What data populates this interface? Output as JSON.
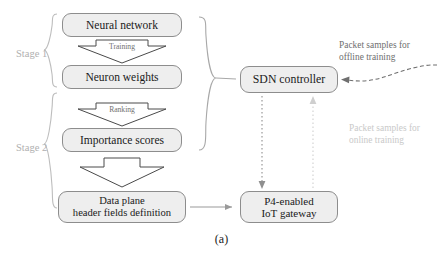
{
  "figure": {
    "caption": "(a)",
    "stages": [
      {
        "id": "stage-1",
        "label": "Stage 1"
      },
      {
        "id": "stage-2",
        "label": "Stage 2"
      }
    ],
    "boxes": [
      {
        "id": "neural-network",
        "label": "Neural network"
      },
      {
        "id": "neuron-weights",
        "label": "Neuron weights"
      },
      {
        "id": "importance-scores",
        "label": "Importance scores"
      },
      {
        "id": "data-plane",
        "line1": "Data plane",
        "line2": "header fields definition"
      },
      {
        "id": "sdn-controller",
        "label": "SDN controller"
      },
      {
        "id": "p4-gateway",
        "line1": "P4-enabled",
        "line2": "IoT gateway"
      }
    ],
    "block_arrows": [
      {
        "id": "training-arrow",
        "label": "Training"
      },
      {
        "id": "ranking-arrow",
        "label": "Ranking"
      },
      {
        "id": "definition-arrow",
        "label": ""
      }
    ],
    "annotations": [
      {
        "id": "offline-note",
        "line1": "Packet samples for",
        "line2": "offline training"
      },
      {
        "id": "online-note",
        "line1": "Packet samples for",
        "line2": "online training"
      }
    ],
    "colors": {
      "box_fill": "#eeeeee",
      "box_border": "#8d8d8d",
      "text": "#1a1a1a",
      "stage_label": "#b0b0b0",
      "offline_note": "#6f6f6f",
      "online_note": "#c9c9c9",
      "arrow_gray": "#9a9a9a",
      "background": "#ffffff"
    }
  }
}
